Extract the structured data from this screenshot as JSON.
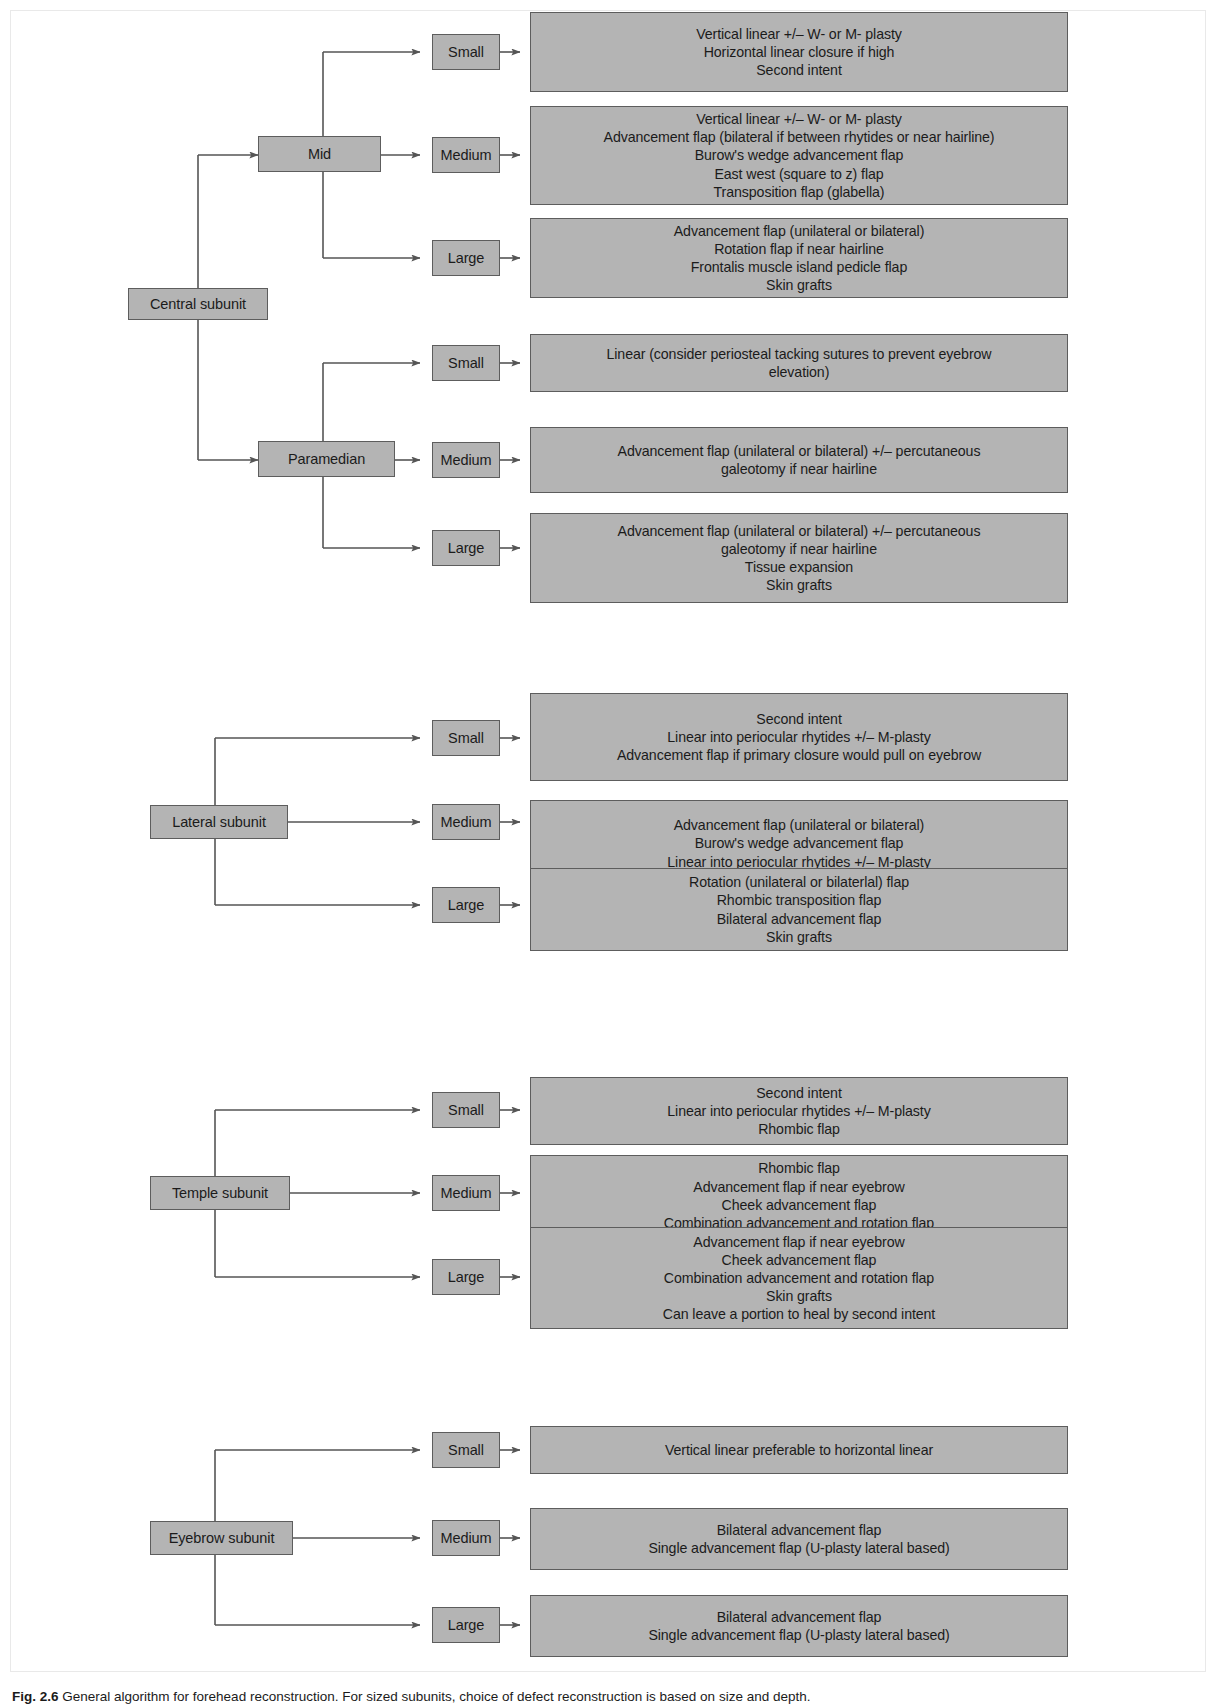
{
  "figure": {
    "caption_prefix": "Fig. 2.6",
    "caption_text": "General algorithm for forehead reconstruction. For sized subunits, choice of defect reconstruction is based on size and depth."
  },
  "diagram": {
    "type": "flowchart",
    "orientation": "left-to-right",
    "size_labels": [
      "Small",
      "Medium",
      "Large"
    ],
    "branches": [
      {
        "subunit": "Central subunit",
        "regions": [
          {
            "region": "Mid",
            "options": [
              {
                "size": "Small",
                "lines": [
                  "Vertical linear +/– W- or M- plasty",
                  "Horizontal linear closure if high",
                  "Second intent"
                ]
              },
              {
                "size": "Medium",
                "lines": [
                  "Vertical linear +/– W- or M- plasty",
                  "Advancement flap (bilateral if between rhytides or near hairline)",
                  "Burow's wedge advancement flap",
                  "East west (square to z) flap",
                  "Transposition flap (glabella)"
                ]
              },
              {
                "size": "Large",
                "lines": [
                  "Advancement flap (unilateral or bilateral)",
                  "Rotation flap if near hairline",
                  "Frontalis muscle island pedicle flap",
                  "Skin grafts"
                ]
              }
            ]
          },
          {
            "region": "Paramedian",
            "options": [
              {
                "size": "Small",
                "lines": [
                  "Linear (consider periosteal tacking sutures to prevent eyebrow",
                  "elevation)"
                ]
              },
              {
                "size": "Medium",
                "lines": [
                  "Advancement flap (unilateral or bilateral) +/– percutaneous",
                  "galeotomy if near hairline"
                ]
              },
              {
                "size": "Large",
                "lines": [
                  "Advancement flap (unilateral or bilateral) +/– percutaneous",
                  "galeotomy if near hairline",
                  "Tissue expansion",
                  "Skin grafts"
                ]
              }
            ]
          }
        ]
      },
      {
        "subunit": "Lateral subunit",
        "regions": [
          {
            "region": "",
            "options": [
              {
                "size": "Small",
                "lines": [
                  "Second intent",
                  "Linear into periocular rhytides +/– M-plasty",
                  "Advancement flap if primary closure would pull on eyebrow"
                ]
              },
              {
                "size": "Medium",
                "lines": [
                  "Advancement flap (unilateral or bilateral)",
                  "Burow's wedge advancement flap",
                  "Linear into periocular rhytides +/– M-plasty",
                  "Second intent (not first line)"
                ]
              },
              {
                "size": "Large",
                "lines": [
                  "Rotation (unilateral or bilaterlal) flap",
                  "Rhombic transposition flap",
                  "Bilateral advancement flap",
                  "Skin grafts"
                ]
              }
            ]
          }
        ]
      },
      {
        "subunit": "Temple subunit",
        "regions": [
          {
            "region": "",
            "options": [
              {
                "size": "Small",
                "lines": [
                  "Second intent",
                  "Linear into periocular rhytides +/– M-plasty",
                  "Rhombic flap"
                ]
              },
              {
                "size": "Medium",
                "lines": [
                  "Rhombic flap",
                  "Advancement flap if near eyebrow",
                  "Cheek advancement flap",
                  "Combination advancement and rotation flap",
                  "Skin grafts",
                  "Can leave a portion to heal by second intent"
                ]
              },
              {
                "size": "Large",
                "lines": [
                  "Advancement flap if near eyebrow",
                  "Cheek advancement flap",
                  "Combination advancement and rotation flap",
                  "Skin grafts",
                  "Can leave a portion to heal by second intent"
                ]
              }
            ]
          }
        ]
      },
      {
        "subunit": "Eyebrow subunit",
        "regions": [
          {
            "region": "",
            "options": [
              {
                "size": "Small",
                "lines": [
                  "Vertical linear preferable to horizontal linear"
                ]
              },
              {
                "size": "Medium",
                "lines": [
                  "Bilateral advancement flap",
                  "Single advancement flap (U-plasty lateral based)"
                ]
              },
              {
                "size": "Large",
                "lines": [
                  "Bilateral advancement flap",
                  "Single advancement flap (U-plasty lateral based)"
                ]
              }
            ]
          }
        ]
      }
    ]
  },
  "nodes": {
    "central_subunit": "Central subunit",
    "mid": "Mid",
    "paramedian": "Paramedian",
    "lateral_subunit": "Lateral subunit",
    "temple_subunit": "Temple subunit",
    "eyebrow_subunit": "Eyebrow subunit",
    "small": "Small",
    "medium": "Medium",
    "large": "Large",
    "c_mid_small": "Vertical linear +/– W- or M- plasty\nHorizontal linear closure if high\nSecond intent",
    "c_mid_medium": "Vertical linear +/– W- or M- plasty\nAdvancement flap (bilateral if between rhytides or near hairline)\nBurow's wedge advancement flap\nEast west (square to z) flap\nTransposition flap (glabella)",
    "c_mid_large": "Advancement flap (unilateral or bilateral)\nRotation flap if near hairline\nFrontalis muscle island pedicle flap\nSkin grafts",
    "c_par_small": "Linear (consider periosteal tacking sutures to prevent eyebrow\nelevation)",
    "c_par_medium": "Advancement flap (unilateral or bilateral) +/– percutaneous\ngaleotomy if near hairline",
    "c_par_large": "Advancement flap (unilateral or bilateral) +/– percutaneous\ngaleotomy if near hairline\nTissue expansion\nSkin grafts",
    "lat_small": "Second intent\nLinear into periocular rhytides +/– M-plasty\nAdvancement flap if primary closure would pull on eyebrow",
    "lat_medium": "Advancement flap (unilateral or bilateral)\nBurow's wedge advancement flap\nLinear into periocular rhytides +/– M-plasty\nSecond intent (not first line)",
    "lat_large": "Rotation (unilateral or bilaterlal) flap\nRhombic transposition flap\nBilateral advancement flap\nSkin grafts",
    "tem_small": "Second intent\nLinear into periocular rhytides +/– M-plasty\nRhombic flap",
    "tem_medium": "Rhombic flap\nAdvancement flap if near eyebrow\nCheek advancement flap\nCombination advancement and rotation flap\nSkin grafts\nCan leave a portion to heal by second intent",
    "tem_large": "Advancement flap if near eyebrow\nCheek advancement flap\nCombination advancement and rotation flap\nSkin grafts\nCan leave a portion to heal by second intent",
    "eye_small": "Vertical linear preferable to horizontal linear",
    "eye_medium": "Bilateral advancement flap\nSingle advancement flap (U-plasty lateral based)",
    "eye_large": "Bilateral advancement flap\nSingle advancement flap (U-plasty lateral based)"
  },
  "style": {
    "node_fill": "#b4b4b4",
    "node_border": "#5d5d5d",
    "line_color": "#555555",
    "text_color": "#1b1b1b",
    "background": "#ffffff"
  }
}
